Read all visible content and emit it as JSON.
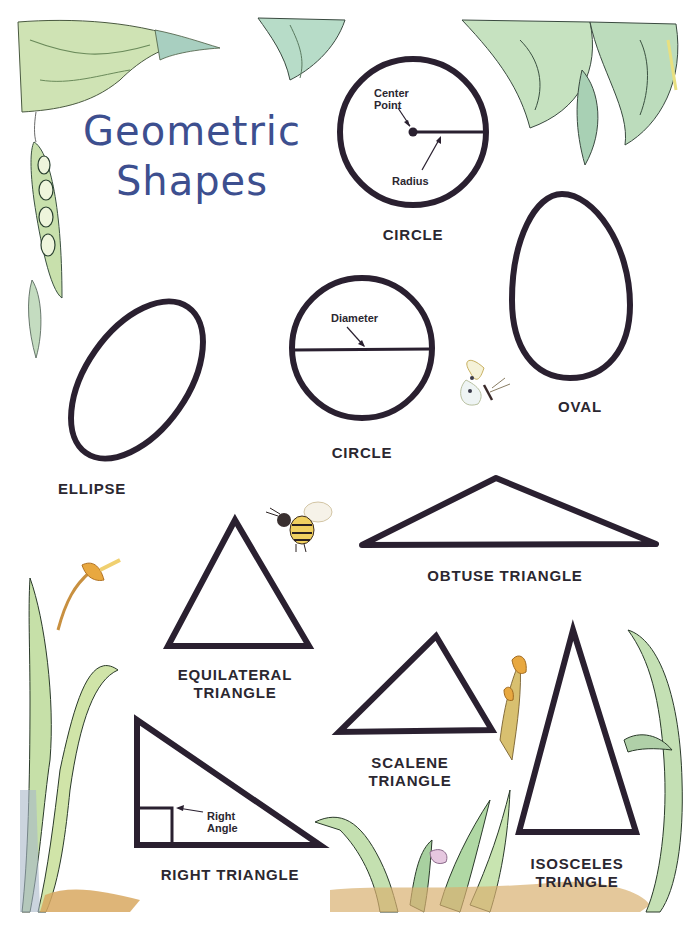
{
  "title": {
    "line1": "Geometric",
    "line2": "Shapes"
  },
  "colors": {
    "title": "#3d4f8f",
    "outline": "#2a2030",
    "text": "#2b2730",
    "leaf_green": "#b9d8a8",
    "stem_gold": "#e0a84a"
  },
  "shapes": [
    {
      "id": "circle-radius",
      "label": "CIRCLE",
      "annotations": [
        "Center Point",
        "Radius"
      ]
    },
    {
      "id": "circle-diameter",
      "label": "CIRCLE",
      "annotations": [
        "Diameter"
      ]
    },
    {
      "id": "oval",
      "label": "OVAL"
    },
    {
      "id": "ellipse",
      "label": "ELLIPSE"
    },
    {
      "id": "obtuse",
      "label": "OBTUSE TRIANGLE"
    },
    {
      "id": "equilateral",
      "label_line1": "EQUILATERAL",
      "label_line2": "TRIANGLE"
    },
    {
      "id": "scalene",
      "label_line1": "SCALENE",
      "label_line2": "TRIANGLE"
    },
    {
      "id": "right",
      "label": "RIGHT TRIANGLE",
      "annotation_line1": "Right",
      "annotation_line2": "Angle"
    },
    {
      "id": "isosceles",
      "label_line1": "ISOSCELES",
      "label_line2": "TRIANGLE"
    }
  ],
  "annotations": {
    "center_line1": "Center",
    "center_line2": "Point",
    "radius": "Radius",
    "diameter": "Diameter"
  },
  "decorations": [
    "leaves-top-left",
    "pea-pod",
    "leaves-top-right",
    "butterfly",
    "bee",
    "grass-left",
    "grass-bottom",
    "grass-right"
  ]
}
